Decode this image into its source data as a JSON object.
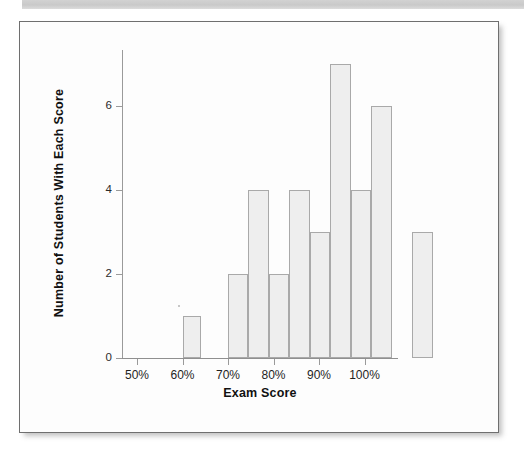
{
  "document": {
    "kind": "scanned-page",
    "background_color": "#ffffff",
    "card_border_color": "#6f6f6f",
    "scan_band_color": "#c9c9c9"
  },
  "chart_data": {
    "type": "bar",
    "title": "",
    "subtitle": "",
    "xlabel": "Exam Score",
    "ylabel": "Number of Students With Each Score",
    "grid": false,
    "legend": "none",
    "xlim": [
      47.5,
      107.5
    ],
    "ylim": [
      0,
      7.6
    ],
    "x_tick_labels": [
      "50%",
      "60%",
      "70%",
      "80%",
      "90%",
      "100%"
    ],
    "x_tick_values": [
      50,
      60,
      70,
      80,
      90,
      100
    ],
    "y_tick_labels": [
      "0",
      "2",
      "4",
      "6"
    ],
    "y_tick_values": [
      0,
      2,
      4,
      6
    ],
    "bin_width": 5,
    "categories": [
      "50-55%",
      "55-60%",
      "60-65%",
      "65-70%",
      "70-75%",
      "75-80%",
      "80-85%",
      "85-90%",
      "90-95%",
      "95-100%",
      "100-105%"
    ],
    "bin_starts": [
      50,
      55,
      60,
      65,
      70,
      75,
      80,
      85,
      90,
      95,
      100
    ],
    "values": [
      0,
      0,
      1,
      0,
      2,
      4,
      2,
      4,
      3,
      7,
      4
    ],
    "bars": [
      {
        "label": "60-65%",
        "bin_start": 60.0,
        "bin_end": 64.0,
        "value": 1
      },
      {
        "label": "70-75%",
        "bin_start": 70.0,
        "bin_end": 74.5,
        "value": 2
      },
      {
        "label": "75-80%",
        "bin_start": 74.5,
        "bin_end": 79.0,
        "value": 4
      },
      {
        "label": "80-85%",
        "bin_start": 79.0,
        "bin_end": 83.5,
        "value": 2
      },
      {
        "label": "85-90%",
        "bin_start": 83.5,
        "bin_end": 88.0,
        "value": 4
      },
      {
        "label": "90-95%",
        "bin_start": 88.0,
        "bin_end": 92.5,
        "value": 3
      },
      {
        "label": "95-100%",
        "bin_start": 92.5,
        "bin_end": 97.0,
        "value": 7
      },
      {
        "label": "100-105%",
        "bin_start": 97.0,
        "bin_end": 101.5,
        "value": 4
      },
      {
        "label": "105-110%",
        "bin_start": 101.5,
        "bin_end": 106.0,
        "value": 6
      },
      {
        "label": "110-115%",
        "bin_start": 110.5,
        "bin_end": 115.0,
        "value": 3
      }
    ],
    "bar_fill_color": "#eeeeee",
    "bar_border_color": "#a9a9a9",
    "axis_color": "#8f8f8f",
    "total_students": 36
  },
  "axes": {
    "x_title": "Exam Score",
    "y_title": "Number of Students With Each Score",
    "x_ticks": [
      {
        "label": "50%"
      },
      {
        "label": "60%"
      },
      {
        "label": "70%"
      },
      {
        "label": "80%"
      },
      {
        "label": "90%"
      },
      {
        "label": "100%"
      }
    ],
    "y_ticks": [
      {
        "label": "6"
      },
      {
        "label": "4"
      },
      {
        "label": "2"
      },
      {
        "label": "0"
      }
    ]
  }
}
